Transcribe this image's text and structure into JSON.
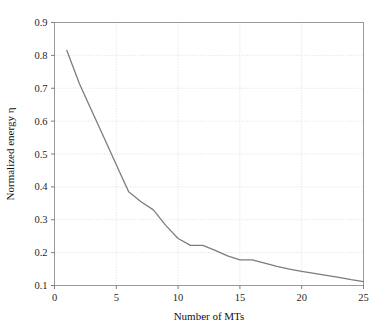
{
  "chart_data": {
    "type": "line",
    "title": "",
    "xlabel": "Number of MTs",
    "ylabel": "Normalized energy η",
    "xlim": [
      0,
      25
    ],
    "ylim": [
      0.1,
      0.9
    ],
    "xticks": [
      0,
      5,
      10,
      15,
      20,
      25
    ],
    "xtick_labels": [
      "0",
      "5",
      "10",
      "15",
      "20",
      "25"
    ],
    "yticks": [
      0.1,
      0.2,
      0.3,
      0.4,
      0.5,
      0.6,
      0.7,
      0.8,
      0.9
    ],
    "ytick_labels": [
      "0.1",
      "0.2",
      "0.3",
      "0.4",
      "0.5",
      "0.6",
      "0.7",
      "0.8",
      "0.9"
    ],
    "grid": true,
    "grid_style": "dotted",
    "grid_color": "#d8d8d8",
    "legend": null,
    "series": [
      {
        "name": "normalized energy",
        "color": "#7d7d7d",
        "line_width": 1.3,
        "x": [
          1,
          2,
          3,
          4,
          5,
          6,
          7,
          8,
          9,
          10,
          11,
          12,
          13,
          14,
          15,
          16,
          17,
          18,
          19,
          20,
          21,
          22,
          23,
          24,
          25
        ],
        "y": [
          0.815,
          0.715,
          0.632,
          0.55,
          0.467,
          0.385,
          0.355,
          0.33,
          0.283,
          0.243,
          0.222,
          0.222,
          0.207,
          0.19,
          0.178,
          0.178,
          0.168,
          0.158,
          0.15,
          0.143,
          0.137,
          0.131,
          0.125,
          0.118,
          0.112
        ]
      }
    ]
  },
  "figure": {
    "frame_color": "#9a9a9a",
    "background": "#ffffff",
    "tick_color": "#6e6e6e"
  }
}
